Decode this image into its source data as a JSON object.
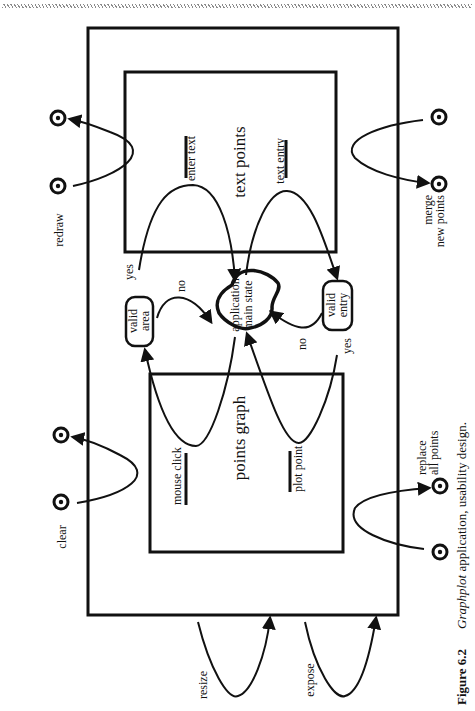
{
  "figure": {
    "number": "Figure 6.2",
    "caption_italic": "Graphplot",
    "caption_rest": " application, usability design."
  },
  "states": {
    "main": {
      "line1": "application",
      "line2": "main state"
    },
    "text_points": {
      "title": "text points",
      "enter_text": "enter text",
      "text_entry": "text entry"
    },
    "points_graph": {
      "title": "points graph",
      "mouse_click": "mouse click",
      "plot_point": "plot point"
    },
    "valid_area": {
      "line1": "valid",
      "line2": "area"
    },
    "valid_entry": {
      "line1": "valid",
      "line2": "entry"
    }
  },
  "transitions": {
    "area_yes": "yes",
    "area_no": "no",
    "entry_no": "no",
    "entry_yes": "yes"
  },
  "external_events": {
    "redraw": "redraw",
    "merge": {
      "line1": "merge",
      "line2": "new points"
    },
    "clear": "clear",
    "replace": {
      "line1": "replace",
      "line2": "all points"
    },
    "resize": "resize",
    "expose": "expose"
  }
}
